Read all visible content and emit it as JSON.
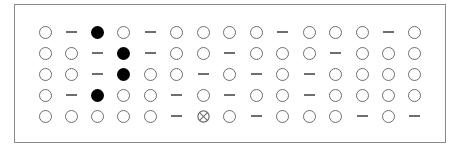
{
  "diagram": {
    "legend_symbols": {
      "O": "open-circle",
      "F": "filled-circle",
      "-": "dash",
      "X": "crossed-circle"
    },
    "colors": {
      "border": "#8a8a8a",
      "outline": "#6e6e6e",
      "filled": "#000000",
      "background": "#ffffff"
    },
    "rows": [
      [
        "O",
        "-",
        "F",
        "O",
        "-",
        "O",
        "O",
        "O",
        "O",
        "-",
        "O",
        "O",
        "O",
        "-",
        "O"
      ],
      [
        "O",
        "O",
        "-",
        "F",
        "-",
        "O",
        "O",
        "-",
        "O",
        "O",
        "O",
        "-",
        "O",
        "O",
        "O"
      ],
      [
        "O",
        "O",
        "-",
        "F",
        "O",
        "O",
        "-",
        "O",
        "-",
        "O",
        "-",
        "O",
        "O",
        "O",
        "O"
      ],
      [
        "O",
        "-",
        "F",
        "O",
        "O",
        "-",
        "O",
        "-",
        "O",
        "O",
        "-",
        "O",
        "O",
        "O",
        "O"
      ],
      [
        "O",
        "O",
        "O",
        "O",
        "O",
        "-",
        "X",
        "O",
        "-",
        "O",
        "O",
        "O",
        "-",
        "O",
        "-"
      ]
    ]
  }
}
